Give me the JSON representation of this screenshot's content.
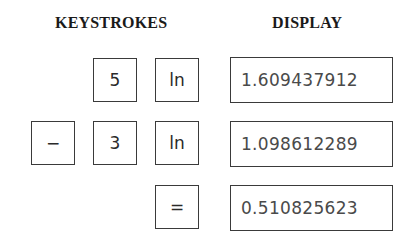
{
  "headers": {
    "keystrokes": "KEYSTROKES",
    "display": "DISPLAY"
  },
  "rows": [
    {
      "keys": [
        "5",
        "ln"
      ],
      "display": "1.609437912"
    },
    {
      "keys": [
        "−",
        "3",
        "ln"
      ],
      "display": "1.098612289"
    },
    {
      "keys": [
        "="
      ],
      "display": "0.510825623"
    }
  ]
}
